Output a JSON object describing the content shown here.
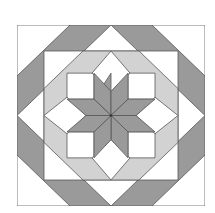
{
  "diagram": {
    "title": "Lemoyne star quilt block",
    "colors": {
      "background": "#ffffff",
      "dark": "#9a9a9a",
      "light": "#d2d2d2",
      "white": "#ffffff",
      "line": "#555555"
    },
    "parts": [
      "outer-square",
      "dark-octagon-band",
      "white-diamond",
      "inner-square",
      "light-octagon-band",
      "white-squares",
      "white-diamonds",
      "eight-point-star"
    ]
  }
}
